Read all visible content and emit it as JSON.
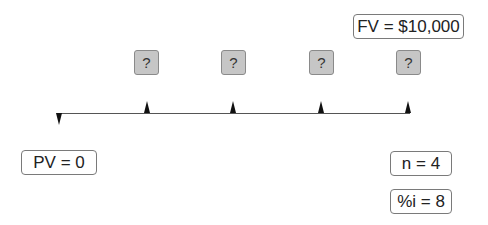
{
  "diagram": {
    "future_value_label": "FV = $10,000",
    "present_value_label": "PV = 0",
    "periods_label": "n = 4",
    "interest_label": "%i = 8",
    "payments": [
      {
        "label": "?"
      },
      {
        "label": "?"
      },
      {
        "label": "?"
      },
      {
        "label": "?"
      }
    ],
    "colors": {
      "payment_box_fill": "#c6c6c6",
      "payment_box_border": "#8a8a8a",
      "label_border": "#7a7a7a",
      "arrow": "#111111",
      "timeline": "#555555"
    }
  }
}
